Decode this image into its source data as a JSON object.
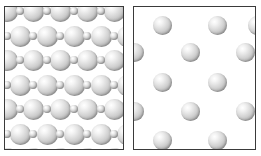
{
  "figure": {
    "type": "scientific-illustration",
    "background_color": "#ffffff",
    "border_color": "#3a3a3a",
    "sphere_fill_light": "#ffffff",
    "sphere_fill_mid": "#cfcfcf",
    "sphere_fill_dark": "#8a8a8a",
    "panel_count": 2
  },
  "panels": [
    {
      "name": "dense-binary-lattice",
      "x": 4,
      "y": 6,
      "width": 120,
      "height": 144,
      "lattice": "binary square array of alternating large and small spheres",
      "large_radius": 10.5,
      "small_radius": 4,
      "column_spacing": 27,
      "row_spacing": 24.5,
      "large_spheres": [
        {
          "cx": 2,
          "cy": 4,
          "r": 10.5
        },
        {
          "cx": 28,
          "cy": 4,
          "r": 10.5
        },
        {
          "cx": 55,
          "cy": 4,
          "r": 10.5
        },
        {
          "cx": 82,
          "cy": 4,
          "r": 10.5
        },
        {
          "cx": 109,
          "cy": 4,
          "r": 10.5
        },
        {
          "cx": 15,
          "cy": 29,
          "r": 10.5
        },
        {
          "cx": 42,
          "cy": 29,
          "r": 10.5
        },
        {
          "cx": 69,
          "cy": 29,
          "r": 10.5
        },
        {
          "cx": 96,
          "cy": 29,
          "r": 10.5
        },
        {
          "cx": 122,
          "cy": 29,
          "r": 10.5
        },
        {
          "cx": 2,
          "cy": 53,
          "r": 10.5
        },
        {
          "cx": 28,
          "cy": 53,
          "r": 10.5
        },
        {
          "cx": 55,
          "cy": 53,
          "r": 10.5
        },
        {
          "cx": 82,
          "cy": 53,
          "r": 10.5
        },
        {
          "cx": 109,
          "cy": 53,
          "r": 10.5
        },
        {
          "cx": 15,
          "cy": 78,
          "r": 10.5
        },
        {
          "cx": 42,
          "cy": 78,
          "r": 10.5
        },
        {
          "cx": 69,
          "cy": 78,
          "r": 10.5
        },
        {
          "cx": 96,
          "cy": 78,
          "r": 10.5
        },
        {
          "cx": 122,
          "cy": 78,
          "r": 10.5
        },
        {
          "cx": 2,
          "cy": 102,
          "r": 10.5
        },
        {
          "cx": 28,
          "cy": 102,
          "r": 10.5
        },
        {
          "cx": 55,
          "cy": 102,
          "r": 10.5
        },
        {
          "cx": 82,
          "cy": 102,
          "r": 10.5
        },
        {
          "cx": 109,
          "cy": 102,
          "r": 10.5
        },
        {
          "cx": 15,
          "cy": 127,
          "r": 10.5
        },
        {
          "cx": 42,
          "cy": 127,
          "r": 10.5
        },
        {
          "cx": 69,
          "cy": 127,
          "r": 10.5
        },
        {
          "cx": 96,
          "cy": 127,
          "r": 10.5
        },
        {
          "cx": 122,
          "cy": 127,
          "r": 10.5
        },
        {
          "cx": 2,
          "cy": 151,
          "r": 10.5
        },
        {
          "cx": 28,
          "cy": 151,
          "r": 10.5
        },
        {
          "cx": 55,
          "cy": 151,
          "r": 10.5
        },
        {
          "cx": 82,
          "cy": 151,
          "r": 10.5
        },
        {
          "cx": 109,
          "cy": 151,
          "r": 10.5
        }
      ],
      "small_spheres": [
        {
          "cx": 15,
          "cy": 4,
          "r": 4
        },
        {
          "cx": 42,
          "cy": 4,
          "r": 4
        },
        {
          "cx": 69,
          "cy": 4,
          "r": 4
        },
        {
          "cx": 96,
          "cy": 4,
          "r": 4
        },
        {
          "cx": 122,
          "cy": 4,
          "r": 4
        },
        {
          "cx": 2,
          "cy": 29,
          "r": 4
        },
        {
          "cx": 28,
          "cy": 29,
          "r": 4
        },
        {
          "cx": 55,
          "cy": 29,
          "r": 4
        },
        {
          "cx": 82,
          "cy": 29,
          "r": 4
        },
        {
          "cx": 109,
          "cy": 29,
          "r": 4
        },
        {
          "cx": 15,
          "cy": 53,
          "r": 4
        },
        {
          "cx": 42,
          "cy": 53,
          "r": 4
        },
        {
          "cx": 69,
          "cy": 53,
          "r": 4
        },
        {
          "cx": 96,
          "cy": 53,
          "r": 4
        },
        {
          "cx": 122,
          "cy": 53,
          "r": 4
        },
        {
          "cx": 2,
          "cy": 78,
          "r": 4
        },
        {
          "cx": 28,
          "cy": 78,
          "r": 4
        },
        {
          "cx": 55,
          "cy": 78,
          "r": 4
        },
        {
          "cx": 82,
          "cy": 78,
          "r": 4
        },
        {
          "cx": 109,
          "cy": 78,
          "r": 4
        },
        {
          "cx": 15,
          "cy": 102,
          "r": 4
        },
        {
          "cx": 42,
          "cy": 102,
          "r": 4
        },
        {
          "cx": 69,
          "cy": 102,
          "r": 4
        },
        {
          "cx": 96,
          "cy": 102,
          "r": 4
        },
        {
          "cx": 122,
          "cy": 102,
          "r": 4
        },
        {
          "cx": 2,
          "cy": 127,
          "r": 4
        },
        {
          "cx": 28,
          "cy": 127,
          "r": 4
        },
        {
          "cx": 55,
          "cy": 127,
          "r": 4
        },
        {
          "cx": 82,
          "cy": 127,
          "r": 4
        },
        {
          "cx": 109,
          "cy": 127,
          "r": 4
        },
        {
          "cx": 15,
          "cy": 151,
          "r": 4
        },
        {
          "cx": 42,
          "cy": 151,
          "r": 4
        },
        {
          "cx": 69,
          "cy": 151,
          "r": 4
        },
        {
          "cx": 96,
          "cy": 151,
          "r": 4
        },
        {
          "cx": 122,
          "cy": 151,
          "r": 4
        }
      ]
    },
    {
      "name": "sparse-uniform-lattice",
      "x": 133,
      "y": 6,
      "width": 123,
      "height": 144,
      "lattice": "staggered array of uniform spheres",
      "sphere_radius": 9.5,
      "column_spacing": 55,
      "row_spacing": 30,
      "spheres": [
        {
          "cx": 28,
          "cy": 18,
          "r": 9.5
        },
        {
          "cx": 83,
          "cy": 18,
          "r": 9.5
        },
        {
          "cx": 123,
          "cy": 18,
          "r": 9.5
        },
        {
          "cx": 0,
          "cy": 45,
          "r": 9.5
        },
        {
          "cx": 56,
          "cy": 45,
          "r": 9.5
        },
        {
          "cx": 111,
          "cy": 45,
          "r": 9.5
        },
        {
          "cx": 28,
          "cy": 75,
          "r": 9.5
        },
        {
          "cx": 83,
          "cy": 75,
          "r": 9.5
        },
        {
          "cx": 0,
          "cy": 104,
          "r": 9.5
        },
        {
          "cx": 56,
          "cy": 104,
          "r": 9.5
        },
        {
          "cx": 111,
          "cy": 104,
          "r": 9.5
        },
        {
          "cx": 28,
          "cy": 133,
          "r": 9.5
        },
        {
          "cx": 83,
          "cy": 133,
          "r": 9.5
        }
      ]
    }
  ]
}
